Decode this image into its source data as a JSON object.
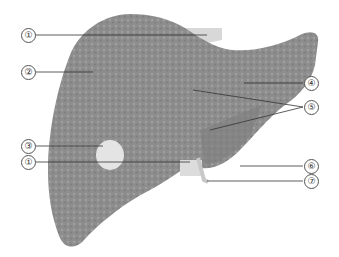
{
  "figure": {
    "colors": {
      "liver": "#8a8a8a",
      "liver_texture": "#a3a3a3",
      "ligament": "#d6d6d6",
      "gallbladder": "#e2e2e2",
      "leader_line": "#333333"
    }
  },
  "callouts": [
    {
      "label": "①",
      "x": 21,
      "y": 28
    },
    {
      "label": "②",
      "x": 21,
      "y": 65
    },
    {
      "label": "③",
      "x": 21,
      "y": 139
    },
    {
      "label": "①",
      "x": 21,
      "y": 155
    },
    {
      "label": "④",
      "x": 304,
      "y": 76
    },
    {
      "label": "⑤",
      "x": 304,
      "y": 100
    },
    {
      "label": "⑥",
      "x": 304,
      "y": 159
    },
    {
      "label": "⑦",
      "x": 304,
      "y": 174
    }
  ]
}
